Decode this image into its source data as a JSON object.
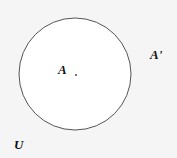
{
  "diagram": {
    "type": "venn",
    "set_label": "A",
    "complement_label": "A'",
    "universe_label": "U",
    "colors": {
      "background": "#f5f5f5",
      "circle_fill": "#ffffff",
      "circle_stroke": "#555555"
    }
  }
}
